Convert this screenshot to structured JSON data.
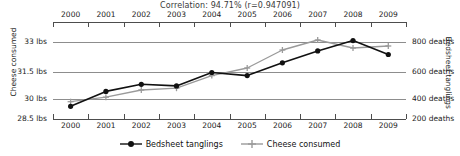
{
  "chart_data": {
    "type": "line",
    "title": "Correlation: 94.71% (r=0.947091)",
    "xlabel": "",
    "grid": true,
    "legend_position": "bottom",
    "x": [
      2000,
      2001,
      2002,
      2003,
      2004,
      2005,
      2006,
      2007,
      2008,
      2009
    ],
    "categories": [
      "2000",
      "2001",
      "2002",
      "2003",
      "2004",
      "2005",
      "2006",
      "2007",
      "2008",
      "2009"
    ],
    "axes": [
      {
        "side": "left",
        "label": "Cheese consumed",
        "ticks": [
          33,
          31.5,
          30,
          28.5
        ],
        "tick_labels": [
          "33 lbs",
          "31.5 lbs",
          "30 lbs",
          "28.5 lbs"
        ],
        "ylim": [
          28.5,
          33.5
        ]
      },
      {
        "side": "right",
        "label": "Bedsheet tanglings",
        "ticks": [
          800,
          600,
          400,
          200
        ],
        "tick_labels": [
          "800 deaths",
          "600 deaths",
          "400 deaths",
          "200 deaths"
        ],
        "ylim": [
          200,
          866.7
        ]
      }
    ],
    "series": [
      {
        "name": "Bedsheet tanglings",
        "axis": "right",
        "unit": "deaths",
        "color": "#111111",
        "marker": "circle",
        "values": [
          327,
          456,
          509,
          497,
          596,
          573,
          661,
          741,
          809,
          717
        ]
      },
      {
        "name": "Cheese consumed",
        "axis": "left",
        "unit": "lbs",
        "color": "#9a9a9a",
        "marker": "plus",
        "values": [
          29.8,
          30.1,
          30.5,
          30.6,
          31.3,
          31.7,
          32.6,
          33.1,
          32.7,
          32.8
        ]
      }
    ]
  },
  "legend": {
    "items": [
      {
        "label": "Bedsheet tanglings",
        "color": "#111111",
        "marker": "circle"
      },
      {
        "label": "Cheese consumed",
        "color": "#9a9a9a",
        "marker": "plus"
      }
    ]
  }
}
